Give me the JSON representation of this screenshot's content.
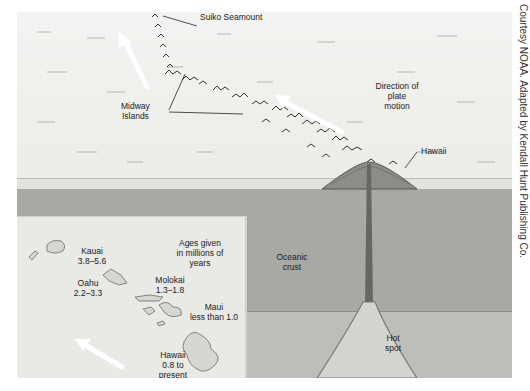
{
  "figure": {
    "labels": {
      "suiko": "Suiko Seamount",
      "midway_line1": "Midway",
      "midway_line2": "Islands",
      "direction_line1": "Direction of",
      "direction_line2": "plate",
      "direction_line3": "motion",
      "hawaii_top": "Hawaii",
      "oceanic_line1": "Oceanic",
      "oceanic_line2": "crust",
      "hotspot_line1": "Hot",
      "hotspot_line2": "spot"
    },
    "inset": {
      "ages_line1": "Ages given",
      "ages_line2": "in millions of",
      "ages_line3": "years",
      "islands": [
        {
          "name": "Kauai",
          "age": "3.8–5.6"
        },
        {
          "name": "Oahu",
          "age": "2.2–3.3"
        },
        {
          "name": "Molokai",
          "age": "1.3–1.8"
        },
        {
          "name": "Maui",
          "age": "less than 1.0"
        },
        {
          "name": "Hawaii",
          "age_line1": "0.8 to",
          "age_line2": "present"
        }
      ]
    },
    "credit": "Courtesy NOAA. Adapted by Kendall Hunt Publishing Co."
  }
}
